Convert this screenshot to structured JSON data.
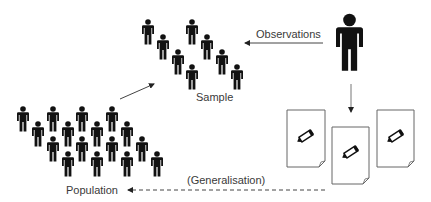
{
  "diagram": {
    "labels": {
      "sample": "Sample",
      "population": "Population",
      "observations": "Observations",
      "generalisation": "(Generalisation)"
    },
    "colors": {
      "figure": "#111111",
      "arrow": "#555555",
      "text": "#3a3a3a",
      "document_border": "#666666"
    },
    "icons": {
      "person": "person-icon",
      "observer": "observer-person-icon",
      "document": "document-with-pencil-icon"
    },
    "sample_people": [
      {
        "x": 142,
        "y": 19
      },
      {
        "x": 186,
        "y": 19
      },
      {
        "x": 157,
        "y": 34
      },
      {
        "x": 201,
        "y": 34
      },
      {
        "x": 172,
        "y": 49
      },
      {
        "x": 216,
        "y": 49
      },
      {
        "x": 186,
        "y": 64
      },
      {
        "x": 231,
        "y": 64
      }
    ],
    "population_people": [
      {
        "x": 17,
        "y": 106
      },
      {
        "x": 47,
        "y": 106
      },
      {
        "x": 76,
        "y": 106
      },
      {
        "x": 106,
        "y": 106
      },
      {
        "x": 32,
        "y": 121
      },
      {
        "x": 62,
        "y": 121
      },
      {
        "x": 91,
        "y": 121
      },
      {
        "x": 121,
        "y": 121
      },
      {
        "x": 47,
        "y": 136
      },
      {
        "x": 76,
        "y": 136
      },
      {
        "x": 106,
        "y": 136
      },
      {
        "x": 136,
        "y": 136
      },
      {
        "x": 62,
        "y": 151
      },
      {
        "x": 91,
        "y": 151
      },
      {
        "x": 121,
        "y": 151
      },
      {
        "x": 151,
        "y": 151
      }
    ],
    "documents": [
      {
        "x": 287,
        "y": 110
      },
      {
        "x": 332,
        "y": 127
      },
      {
        "x": 377,
        "y": 110
      }
    ]
  }
}
